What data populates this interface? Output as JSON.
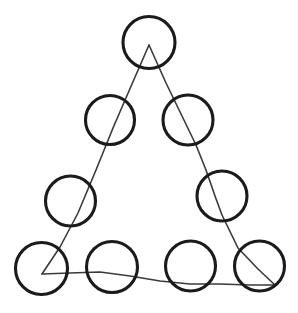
{
  "figure": {
    "kind": "line-drawing",
    "canvas": {
      "width": 298,
      "height": 313,
      "background": "#ffffff"
    },
    "stroke_colors": {
      "circle": "#1b1b1d",
      "triangle": "#3a3a3c"
    },
    "stroke_widths": {
      "circle": 3.1,
      "triangle": 1.6
    },
    "triangle": {
      "label": "triangle-outline",
      "vertices": [
        {
          "name": "apex",
          "x": 149,
          "y": 45
        },
        {
          "name": "bottom-left",
          "x": 42,
          "y": 274
        },
        {
          "name": "bottom-right",
          "x": 275,
          "y": 285
        }
      ],
      "left_edge_path": "M 149 45 L 132 84 L 113 128 L 96 170 L 78 213 L 60 247 L 42 274",
      "right_edge_path": "M 149 45 L 166 83 L 182 116 L 196 145 L 206 170 L 215 196 L 222 215 L 238 248 L 258 269 L 275 285",
      "bottom_edge_path": "M 42 274 L 70 273 L 100 272 L 130 276 L 160 281 L 190 284 L 220 284 L 250 285 L 275 285"
    },
    "circles": [
      {
        "id": "c1",
        "name": "circle-apex",
        "row": 1,
        "position_in_row": 1,
        "cx": 149,
        "cy": 42.5,
        "r": 26
      },
      {
        "id": "c2",
        "name": "circle-row2-left",
        "row": 2,
        "position_in_row": 1,
        "cx": 110,
        "cy": 120,
        "r": 24.5
      },
      {
        "id": "c3",
        "name": "circle-row2-right",
        "row": 2,
        "position_in_row": 2,
        "cx": 188,
        "cy": 120,
        "r": 25
      },
      {
        "id": "c4",
        "name": "circle-row3-left",
        "row": 3,
        "position_in_row": 1,
        "cx": 70.5,
        "cy": 201,
        "r": 25
      },
      {
        "id": "c5",
        "name": "circle-row3-right",
        "row": 3,
        "position_in_row": 2,
        "cx": 222,
        "cy": 196,
        "r": 25
      },
      {
        "id": "c6",
        "name": "circle-row4-first",
        "row": 4,
        "position_in_row": 1,
        "cx": 41.5,
        "cy": 268.5,
        "r": 26
      },
      {
        "id": "c7",
        "name": "circle-row4-second",
        "row": 4,
        "position_in_row": 2,
        "cx": 112,
        "cy": 267,
        "r": 25.5
      },
      {
        "id": "c8",
        "name": "circle-row4-third",
        "row": 4,
        "position_in_row": 3,
        "cx": 190.5,
        "cy": 266,
        "r": 25
      },
      {
        "id": "c9",
        "name": "circle-row4-fourth",
        "row": 4,
        "position_in_row": 4,
        "cx": 259.5,
        "cy": 266,
        "r": 25
      }
    ],
    "counts": {
      "circles": 9,
      "triangle_edges": 3,
      "rows": 4
    }
  }
}
